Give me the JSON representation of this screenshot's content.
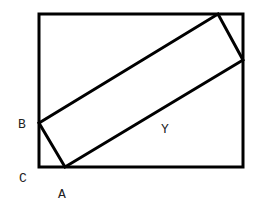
{
  "diagram": {
    "labels": {
      "B": "B",
      "C": "C",
      "A": "A",
      "Y": "Y"
    },
    "outer_rect": {
      "x1": 39,
      "y1": 14,
      "x2": 243,
      "y2": 167
    },
    "inner_rect_points": "39,123 65,167 243,60 218,14",
    "stroke_color": "#000000"
  }
}
